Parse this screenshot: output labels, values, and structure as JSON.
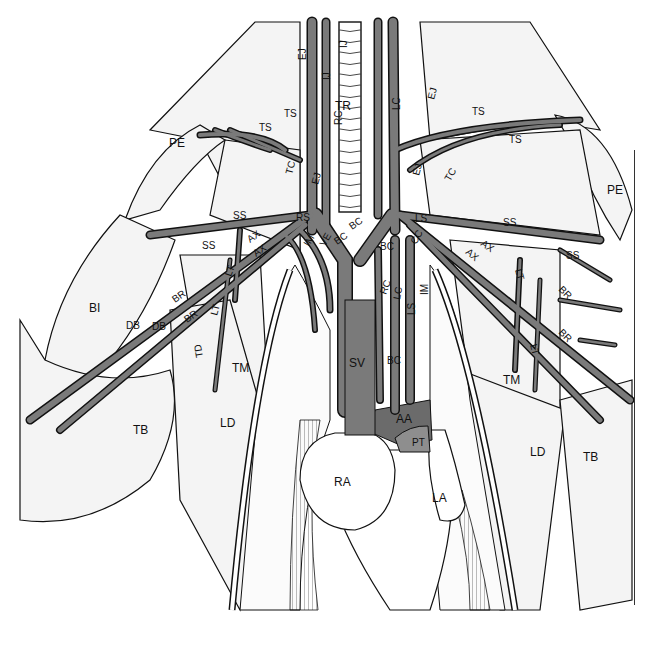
{
  "figure": {
    "colors": {
      "background": "#ffffff",
      "vessel_fill": "#7a7a7a",
      "vessel_outline": "#111111",
      "aorta_fill": "#6b6b6b",
      "pulmonary_trunk_fill": "#8e8e8e",
      "ink": "#111111"
    },
    "labels": {
      "neck": {
        "TR": "TR",
        "EJ_left_upper": "EJ",
        "EJ_left_lower": "EJ",
        "IJ_left": "IJ",
        "IJ_right": "IJ",
        "RC_upper": "RC",
        "LC_upper": "LC",
        "EJ_right_upper": "EJ",
        "EJ_right_lower": "EJ"
      },
      "left_side": {
        "PE": "PE",
        "TS_upper": "TS",
        "TS_lower": "TS",
        "TC": "TC",
        "SS_upper": "SS",
        "SS_lower": "SS",
        "RS": "RS",
        "AX_1": "AX",
        "AX_2": "AX",
        "IM": "IM",
        "VE": "VE",
        "BC": "BC",
        "LT_1": "LT",
        "LT_2": "LT",
        "BR_1": "BR",
        "BR_2": "BR",
        "DB_1": "DB",
        "DB_2": "DB",
        "TD": "TD",
        "BI": "BI",
        "TM": "TM",
        "TB": "TB",
        "LD": "LD"
      },
      "right_side": {
        "PE": "PE",
        "TS_upper": "TS",
        "TS_lower": "TS",
        "TC": "TC",
        "LS": "LS",
        "CC": "CC",
        "SS_upper": "SS",
        "SS_lower": "SS",
        "AX_1": "AX",
        "AX_2": "AX",
        "LT_1": "LT",
        "LT_2": "LT",
        "BR_1": "BR",
        "BR_2": "BR",
        "TM": "TM",
        "LD": "LD",
        "TB": "TB"
      },
      "center": {
        "BC_left": "BC",
        "BC_right": "BC",
        "RC": "RC",
        "LC": "LC",
        "LS": "LS",
        "IM": "IM",
        "BC_lower": "BC",
        "SV": "SV",
        "AA": "AA",
        "PT": "PT",
        "RA": "RA",
        "LA": "LA"
      }
    }
  }
}
